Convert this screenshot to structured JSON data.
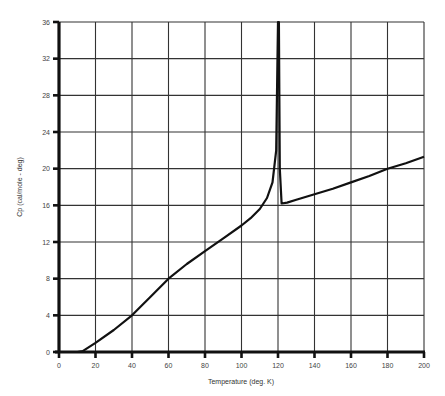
{
  "chart_data": {
    "type": "line",
    "title": "",
    "xlabel": "Temperature (deg. K)",
    "ylabel": "Cp (cal/mole - deg)",
    "xlim": [
      0,
      200
    ],
    "ylim": [
      0,
      36
    ],
    "x_ticks": [
      0,
      20,
      40,
      60,
      80,
      100,
      120,
      140,
      160,
      180,
      200
    ],
    "y_ticks": [
      0,
      4,
      8,
      12,
      16,
      20,
      24,
      28,
      32,
      36
    ],
    "grid": true,
    "legend": null,
    "series": [
      {
        "name": "Cp",
        "x": [
          0,
          10,
          13,
          20,
          30,
          40,
          50,
          60,
          70,
          80,
          90,
          100,
          105,
          110,
          114,
          117,
          119,
          120,
          120.5,
          121,
          122,
          125,
          130,
          140,
          150,
          160,
          170,
          180,
          190,
          200
        ],
        "y": [
          0,
          0,
          0.1,
          1.0,
          2.4,
          4.0,
          6.0,
          8.0,
          9.6,
          11.0,
          12.4,
          13.8,
          14.6,
          15.6,
          16.8,
          18.5,
          22,
          36,
          36,
          20,
          16.2,
          16.3,
          16.6,
          17.2,
          17.8,
          18.5,
          19.2,
          20.0,
          20.6,
          21.3
        ]
      }
    ],
    "annotations": []
  }
}
